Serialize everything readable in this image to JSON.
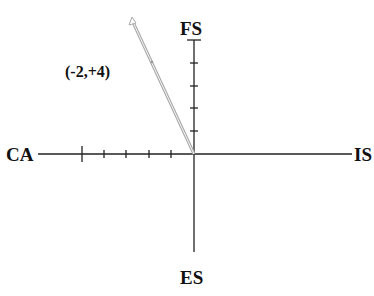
{
  "diagram": {
    "axes": {
      "top": "FS",
      "bottom": "ES",
      "left": "CA",
      "right": "IS"
    },
    "vector": {
      "label": "(-2,+4)",
      "x": -2,
      "y": 4,
      "color": "#a8a8a8"
    },
    "ticks": {
      "vertical_positive_count": 5,
      "horizontal_negative_count": 5
    },
    "colors": {
      "axis": "#222222",
      "text": "#111111"
    }
  }
}
